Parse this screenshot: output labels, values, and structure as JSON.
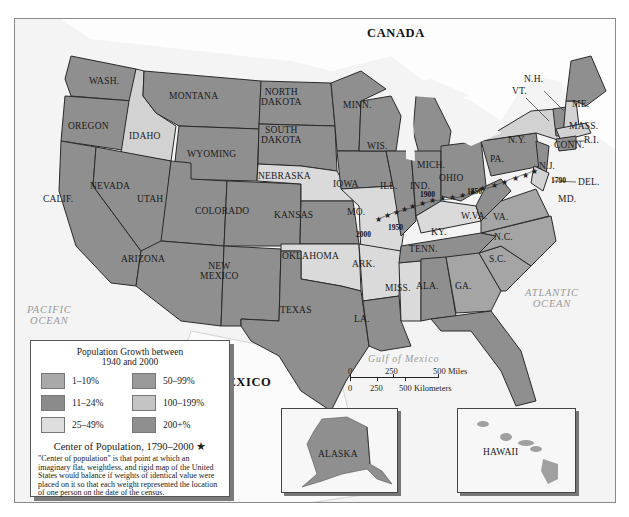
{
  "map": {
    "countries": {
      "canada": "CANADA",
      "mexico": "MEXICO"
    },
    "water": {
      "pacific": "PACIFIC\nOCEAN",
      "pacific_line1": "PACIFIC",
      "pacific_line2": "OCEAN",
      "atlantic_line1": "ATLANTIC",
      "atlantic_line2": "OCEAN",
      "gulf": "Gulf of Mexico"
    },
    "states": {
      "wash": "WASH.",
      "oregon": "OREGON",
      "calif": "CALIF.",
      "idaho": "IDAHO",
      "nevada": "NEVADA",
      "montana": "MONTANA",
      "wyoming": "WYOMING",
      "utah": "UTAH",
      "arizona": "ARIZONA",
      "colorado": "COLORADO",
      "new_mexico_1": "NEW",
      "new_mexico_2": "MEXICO",
      "north_dakota_1": "NORTH",
      "north_dakota_2": "DAKOTA",
      "south_dakota_1": "SOUTH",
      "south_dakota_2": "DAKOTA",
      "nebraska": "NEBRASKA",
      "kansas": "KANSAS",
      "oklahoma": "OKLAHOMA",
      "texas": "TEXAS",
      "minn": "MINN.",
      "iowa": "IOWA",
      "mo": "MO.",
      "ark": "ARK.",
      "la": "LA.",
      "wis": "WIS.",
      "ill": "ILL.",
      "mich": "MICH.",
      "ind": "IND.",
      "ohio": "OHIO",
      "ky": "KY.",
      "tenn": "TENN.",
      "miss": "MISS.",
      "ala": "ALA.",
      "ga": "GA.",
      "fla": "FLA.",
      "sc": "S.C.",
      "nc": "N.C.",
      "va": "VA.",
      "wva": "W.VA.",
      "pa": "PA.",
      "ny": "N.Y.",
      "nj": "N.J.",
      "del": "DEL.",
      "md": "MD.",
      "conn": "CONN.",
      "ri": "R.I.",
      "mass": "MASS.",
      "vt": "VT.",
      "nh": "N.H.",
      "me": "ME.",
      "alaska": "ALASKA",
      "hawaii": "HAWAII"
    },
    "center_years": {
      "y1790": "1790",
      "y1850": "1850",
      "y1900": "1900",
      "y1950": "1950",
      "y2000": "2000"
    }
  },
  "scale_bar": {
    "miles": [
      "0",
      "250",
      "500 Miles"
    ],
    "kilometers": [
      "0",
      "250",
      "500 Kilometers"
    ]
  },
  "legend": {
    "title_line1": "Population Growth between",
    "title_line2": "1940 and 2000",
    "items": [
      {
        "label": "1–10%",
        "color": "#a9a9a9"
      },
      {
        "label": "50–99%",
        "color": "#9a9a9a"
      },
      {
        "label": "11–24%",
        "color": "#8b8b8b"
      },
      {
        "label": "100–199%",
        "color": "#c4c4c4"
      },
      {
        "label": "25–49%",
        "color": "#dedede"
      },
      {
        "label": "200+%",
        "color": "#8f8f8f"
      }
    ],
    "center_title": "Center of Population, 1790–2000 ★",
    "center_description": "\"Center of population\" is that point at which an imaginary flat, weightless, and rigid map of the United States would balance if weights of identical value were placed on it so that each weight represented the location of one person on the date of the census."
  },
  "colors": {
    "land_dark": "#8f8f8f",
    "land_mid": "#a3a3a3",
    "land_light": "#d9d9d9",
    "water": "#f4f4f4",
    "foreign": "#fbfbfb"
  }
}
